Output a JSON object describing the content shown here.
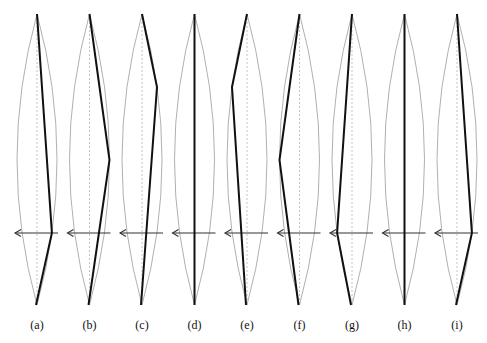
{
  "figure": {
    "type": "multi-panel diagram",
    "arrow_direction": "left",
    "colors": {
      "lens": "#9c9c9c",
      "axis": "#b4b4b4",
      "path": "#111111",
      "arrow": "#333333"
    },
    "panels": [
      {
        "label": "(a)",
        "kink_side": "right",
        "kink_level": "arrow"
      },
      {
        "label": "(b)",
        "kink_side": "right",
        "kink_level": "middle"
      },
      {
        "label": "(c)",
        "kink_side": "right",
        "kink_level": "upper"
      },
      {
        "label": "(d)",
        "kink_side": "none",
        "kink_level": "none"
      },
      {
        "label": "(e)",
        "kink_side": "left",
        "kink_level": "upper"
      },
      {
        "label": "(f)",
        "kink_side": "left",
        "kink_level": "middle"
      },
      {
        "label": "(g)",
        "kink_side": "left",
        "kink_level": "arrow"
      },
      {
        "label": "(h)",
        "kink_side": "none",
        "kink_level": "none"
      },
      {
        "label": "(i)",
        "kink_side": "right",
        "kink_level": "arrow"
      }
    ]
  }
}
